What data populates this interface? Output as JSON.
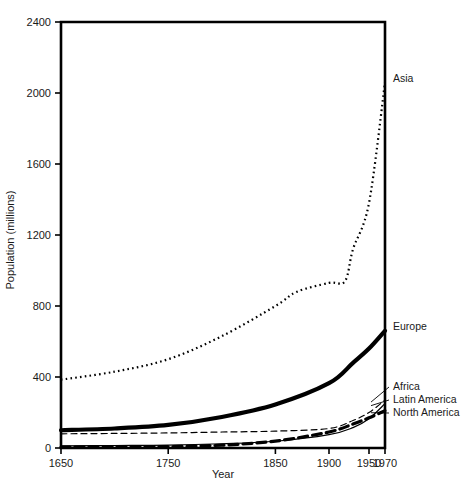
{
  "chart_data": {
    "type": "line",
    "title": "",
    "xlabel": "Year",
    "ylabel": "Population (millions)",
    "xlim": [
      1650,
      1970
    ],
    "ylim": [
      0,
      2400
    ],
    "xticks": [
      1650,
      1750,
      1850,
      1900,
      1950,
      1970
    ],
    "xtick_labels": [
      "1650",
      "1750",
      "1850",
      "1900",
      "1950",
      "1970"
    ],
    "yticks": [
      0,
      400,
      800,
      1200,
      1600,
      2000,
      2400
    ],
    "ytick_labels": [
      "0",
      "400",
      "800",
      "1200",
      "1600",
      "2000",
      "2400"
    ],
    "grid": false,
    "legend_position": "right-inline-labels",
    "series": [
      {
        "name": "Asia",
        "label": "Asia",
        "style": "dotted",
        "width": 2.2,
        "color": "#000000",
        "x": [
          1650,
          1700,
          1750,
          1800,
          1850,
          1870,
          1900,
          1920,
          1930,
          1950,
          1970
        ],
        "values": [
          385,
          430,
          500,
          630,
          800,
          880,
          930,
          940,
          1120,
          1380,
          2060
        ]
      },
      {
        "name": "Europe",
        "label": "Europe",
        "style": "solid",
        "width": 4.2,
        "color": "#000000",
        "x": [
          1650,
          1700,
          1750,
          1800,
          1850,
          1900,
          1930,
          1950,
          1970
        ],
        "values": [
          100,
          110,
          130,
          175,
          245,
          365,
          480,
          560,
          660
        ]
      },
      {
        "name": "Africa",
        "label": "Africa",
        "style": "dashed-thin",
        "width": 1.2,
        "color": "#000000",
        "x": [
          1650,
          1700,
          1750,
          1800,
          1850,
          1900,
          1930,
          1950,
          1970
        ],
        "values": [
          80,
          82,
          85,
          90,
          95,
          110,
          155,
          200,
          270
        ]
      },
      {
        "name": "Latin America",
        "label": "Latin America",
        "style": "solid-thin",
        "width": 1.2,
        "color": "#000000",
        "x": [
          1650,
          1700,
          1750,
          1800,
          1850,
          1900,
          1930,
          1950,
          1970
        ],
        "values": [
          12,
          14,
          16,
          24,
          38,
          75,
          115,
          165,
          250
        ]
      },
      {
        "name": "North America",
        "label": "North America",
        "style": "dashed-thick",
        "width": 3.2,
        "color": "#000000",
        "x": [
          1650,
          1700,
          1750,
          1800,
          1850,
          1900,
          1930,
          1950,
          1970
        ],
        "values": [
          5,
          6,
          8,
          16,
          39,
          90,
          135,
          170,
          210
        ]
      }
    ],
    "annotations": [
      {
        "text": "Asia",
        "series": "Asia"
      },
      {
        "text": "Europe",
        "series": "Europe"
      },
      {
        "text": "Africa",
        "series": "Africa"
      },
      {
        "text": "Latin America",
        "series": "Latin America"
      },
      {
        "text": "North America",
        "series": "North America"
      }
    ]
  }
}
